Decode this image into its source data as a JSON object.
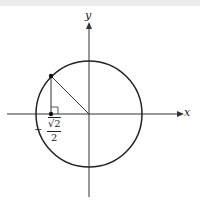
{
  "diagram": {
    "axes": {
      "x_label": "x",
      "y_label": "y"
    },
    "point_label": {
      "sign": "−",
      "numerator": "√2",
      "denominator": "2"
    },
    "colors": {
      "stroke": "#222222",
      "axis": "#333333",
      "band": "#ececec"
    }
  }
}
